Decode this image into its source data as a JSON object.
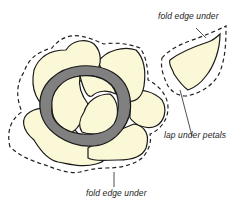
{
  "diagram": {
    "labels": {
      "top_right": "fold edge under",
      "middle_right": "lap under petals",
      "bottom": "fold edge under"
    },
    "colors": {
      "petal_fill": "#fbf8d8",
      "ring_fill": "#808080",
      "outline": "#1a1a1a",
      "dashed_line": "#222222",
      "background": "#ffffff"
    }
  }
}
